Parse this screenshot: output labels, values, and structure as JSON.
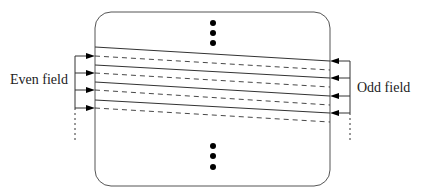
{
  "diagram": {
    "labels": {
      "even": "Even field",
      "odd": "Odd field"
    },
    "colors": {
      "stroke": "#333333",
      "fill": "#000000"
    },
    "box": {
      "x": 95,
      "y": 12,
      "w": 235,
      "h": 174,
      "r": 16
    },
    "solid_lines": [
      [
        95,
        47,
        330,
        61
      ],
      [
        95,
        65,
        330,
        78
      ],
      [
        95,
        82,
        330,
        96
      ],
      [
        95,
        100,
        330,
        113
      ]
    ],
    "dashed_lines": [
      [
        95,
        56,
        330,
        70
      ],
      [
        95,
        73,
        330,
        87
      ],
      [
        95,
        90,
        330,
        105
      ],
      [
        95,
        108,
        330,
        122
      ]
    ],
    "even_arrows_y": [
      56,
      73,
      90,
      108
    ],
    "odd_arrows_y": [
      61,
      78,
      96,
      113
    ],
    "dots_top_y": [
      23,
      33,
      43
    ],
    "dots_bottom_y": [
      146,
      156,
      167
    ],
    "dots_x": 213
  }
}
